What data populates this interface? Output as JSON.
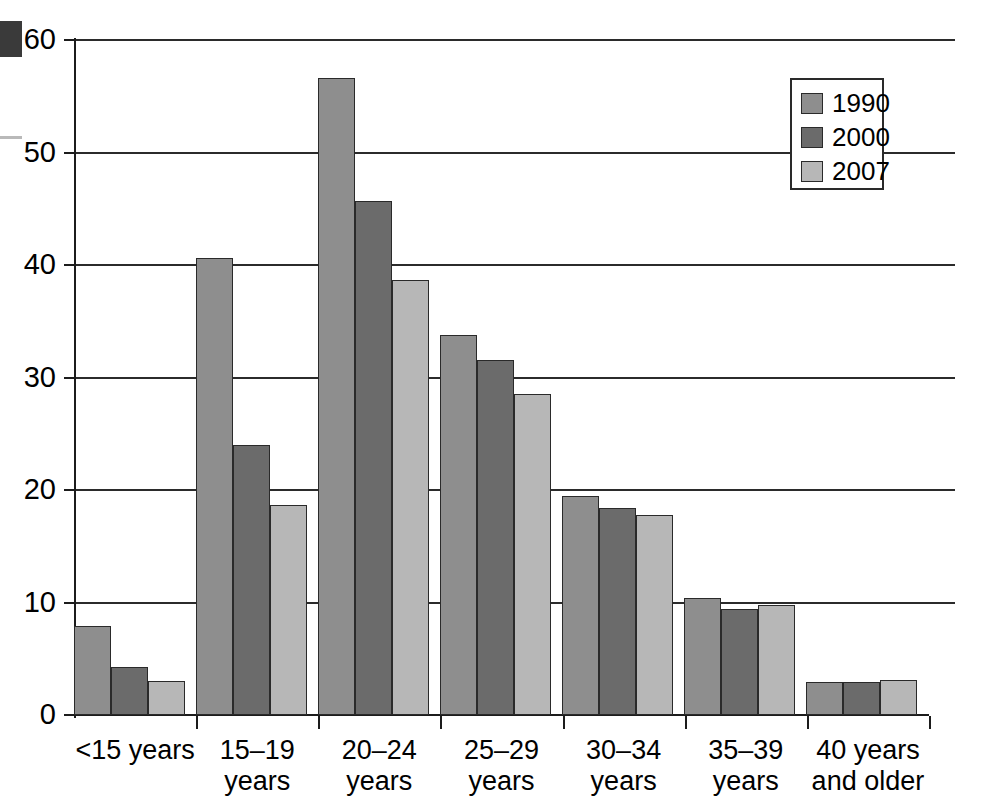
{
  "chart_data": {
    "type": "bar",
    "title": "",
    "subtitle": "",
    "xlabel": "",
    "ylabel": "",
    "ylim": [
      0,
      60
    ],
    "yticks": [
      0,
      10,
      20,
      30,
      40,
      50,
      60
    ],
    "grid": true,
    "legend_position": "top-right",
    "categories": [
      "<15 years",
      "15–19\nyears",
      "20–24\nyears",
      "25–29\nyears",
      "30–34\nyears",
      "35–39\nyears",
      "40 years\nand older"
    ],
    "series": [
      {
        "name": "1990",
        "color": "#8e8e8e",
        "values": [
          7.9,
          40.6,
          56.6,
          33.8,
          19.5,
          10.4,
          2.9
        ]
      },
      {
        "name": "2000",
        "color": "#6b6b6b",
        "values": [
          4.3,
          24.0,
          45.7,
          31.6,
          18.4,
          9.4,
          2.9
        ]
      },
      {
        "name": "2007",
        "color": "#b7b7b7",
        "values": [
          3.0,
          18.7,
          38.7,
          28.5,
          17.8,
          9.8,
          3.1
        ]
      }
    ]
  },
  "legend": {
    "entries": [
      {
        "label": "1990"
      },
      {
        "label": "2000"
      },
      {
        "label": "2007"
      }
    ]
  },
  "colors": {
    "series_1990": "#8e8e8e",
    "series_2000": "#6b6b6b",
    "series_2007": "#b7b7b7",
    "axis": "#1c1c1c",
    "gridline": "#2b2b2b",
    "background": "#ffffff"
  }
}
